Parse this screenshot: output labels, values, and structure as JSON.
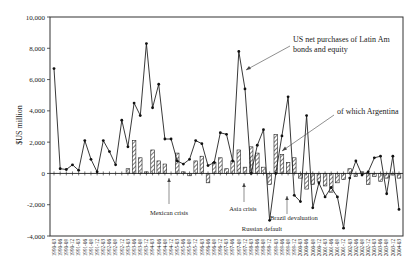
{
  "chart_data": {
    "type": "bar+line",
    "title": "",
    "ylabel": "$US million",
    "xlabel": "",
    "ylim": [
      -4000,
      10000
    ],
    "yticks": [
      10000,
      8000,
      6000,
      4000,
      2000,
      0,
      -2000,
      -4000
    ],
    "ytick_labels": [
      "10,000",
      "8,000",
      "6,000",
      "4,000",
      "2,000",
      "0",
      "-2,000",
      "-4,000"
    ],
    "grid": false,
    "categories": [
      "1990-03",
      "1990-06",
      "1990-09",
      "1990-12",
      "1991-03",
      "1991-06",
      "1991-09",
      "1991-12",
      "1992-03",
      "1992-06",
      "1992-09",
      "1992-12",
      "1993-03",
      "1993-06",
      "1993-09",
      "1993-12",
      "1994-03",
      "1994-06",
      "1994-09",
      "1994-12",
      "1995-03",
      "1995-06",
      "1995-09",
      "1995-12",
      "1996-03",
      "1996-06",
      "1996-09",
      "1996-12",
      "1997-03",
      "1997-06",
      "1997-09",
      "1997-12",
      "1998-03",
      "1998-06",
      "1998-09",
      "1998-12",
      "1999-03",
      "1999-06",
      "1999-09",
      "1999-12",
      "2000-03",
      "2000-06",
      "2000-09",
      "2000-12",
      "2001-03",
      "2001-06",
      "2001-09",
      "2001-12",
      "2002-03",
      "2002-06",
      "2002-09",
      "2002-12",
      "2003-03",
      "2003-06",
      "2003-09",
      "2003-12",
      "2004-03"
    ],
    "series": [
      {
        "name": "US net purchases of Latin Am bonds and equity",
        "type": "line",
        "values": [
          6700,
          300,
          250,
          550,
          200,
          2100,
          900,
          100,
          2100,
          1400,
          550,
          3400,
          1700,
          4500,
          3700,
          8300,
          4200,
          5700,
          2200,
          2200,
          800,
          600,
          900,
          2100,
          1900,
          500,
          700,
          2600,
          2500,
          800,
          7800,
          5400,
          0,
          1800,
          2800,
          -3000,
          0,
          2400,
          4900,
          -1400,
          -1800,
          3700,
          -2200,
          -600,
          -1500,
          -900,
          -1500,
          -3500,
          -300,
          800,
          -100,
          100,
          1000,
          1100,
          -1300,
          1100,
          -2300
        ]
      },
      {
        "name": "of which Argentina",
        "type": "bar",
        "values": [
          0,
          0,
          0,
          0,
          0,
          0,
          0,
          0,
          0,
          0,
          0,
          0,
          300,
          2100,
          1000,
          100,
          1500,
          800,
          600,
          0,
          1300,
          100,
          -150,
          800,
          1100,
          -600,
          700,
          1000,
          300,
          800,
          1500,
          400,
          1700,
          1300,
          400,
          -700,
          2500,
          1200,
          700,
          1000,
          -300,
          -1000,
          -700,
          -500,
          -800,
          -1200,
          -600,
          -400,
          300,
          -200,
          100,
          -700,
          -200,
          -500,
          -300,
          -100,
          -300
        ]
      }
    ],
    "annotations": [
      {
        "text": "US net purchases of Latin Am",
        "text2": "bonds and equity"
      },
      {
        "text": "of which Argentina"
      },
      {
        "text": "Mexican crisis",
        "at": "1994-12"
      },
      {
        "text": "Asia crisis",
        "at": "1997-09"
      },
      {
        "text": "Russian default",
        "at": "1998-09"
      },
      {
        "text": "Brazil devaluation",
        "at": "1999-03"
      }
    ]
  }
}
